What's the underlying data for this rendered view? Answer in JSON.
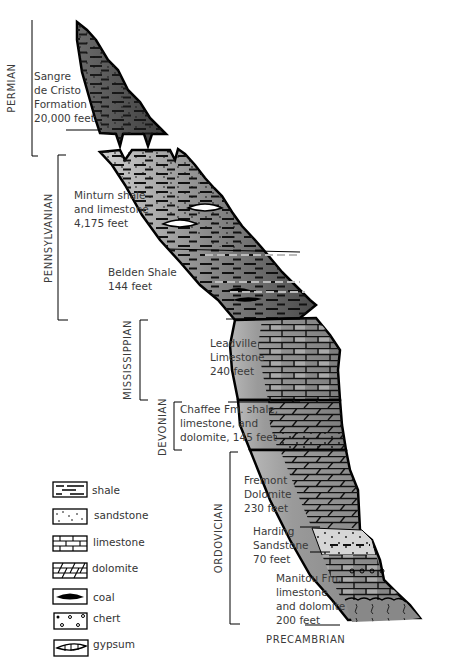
{
  "periods": [
    {
      "name": "PERMIAN"
    },
    {
      "name": "PENNSYLVANIAN"
    },
    {
      "name": "MISSISSIPPIAN"
    },
    {
      "name": "DEVONIAN"
    },
    {
      "name": "ORDOVICIAN"
    }
  ],
  "basement": "PRECAMBRIAN",
  "formations": [
    {
      "lines": [
        "Sangre",
        "de Cristo",
        "Formation",
        "20,000 feet"
      ],
      "lithology": "shale and sandstone"
    },
    {
      "lines": [
        "Minturn shale",
        "and limestone",
        "4,175 feet"
      ],
      "lithology": "shale, sandstone, gypsum"
    },
    {
      "lines": [
        "Belden Shale",
        "144 feet"
      ],
      "lithology": "shale, limestone, coal"
    },
    {
      "lines": [
        "Leadville",
        "Limestone",
        "240 feet"
      ],
      "lithology": "limestone"
    },
    {
      "lines": [
        "Chaffee Fm. shale,",
        "limestone, and",
        "dolomite, 145 feet"
      ],
      "lithology": "dolomite, limestone, shale"
    },
    {
      "lines": [
        "Fremont",
        "Dolomite",
        "230 feet"
      ],
      "lithology": "dolomite"
    },
    {
      "lines": [
        "Harding",
        "Sandstone",
        "70 feet"
      ],
      "lithology": "sandstone"
    },
    {
      "lines": [
        "Manitou Fm.",
        "limestone",
        "and dolomite",
        "200 feet"
      ],
      "lithology": "limestone, dolomite, chert"
    }
  ],
  "legend": [
    {
      "icon": "shale-pattern-icon",
      "label": "shale"
    },
    {
      "icon": "sandstone-pattern-icon",
      "label": "sandstone"
    },
    {
      "icon": "limestone-pattern-icon",
      "label": "limestone"
    },
    {
      "icon": "dolomite-pattern-icon",
      "label": "dolomite"
    },
    {
      "icon": "coal-pattern-icon",
      "label": "coal"
    },
    {
      "icon": "chert-pattern-icon",
      "label": "chert"
    },
    {
      "icon": "gypsum-pattern-icon",
      "label": "gypsum"
    }
  ],
  "colors": {
    "dark_fill": "#555555",
    "mid_fill": "#8c8c8c",
    "light_fill": "#bdbdbd",
    "outline": "#000000",
    "text": "#3a3a3a"
  }
}
